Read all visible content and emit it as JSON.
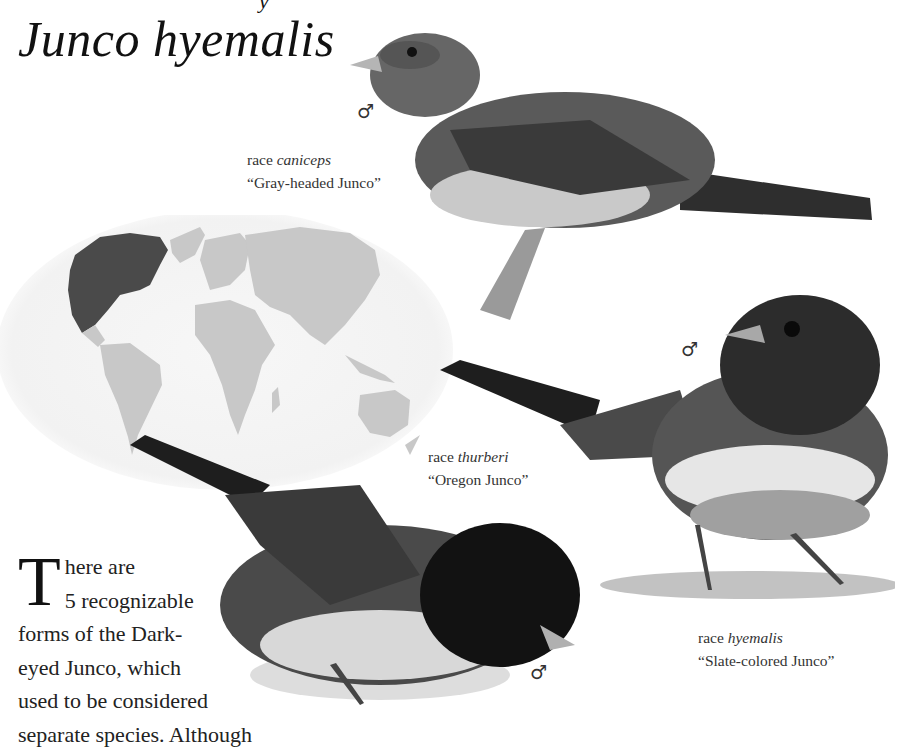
{
  "page": {
    "title_fragment": "y",
    "title": "Junco hyemalis"
  },
  "figures": {
    "map": {
      "label": "range-map",
      "range_color": "#4a4a4a",
      "land_color": "#c8c8c8",
      "ocean_color": "#f4f4f4"
    },
    "birds": [
      {
        "id": "caniceps",
        "sex_symbol": "♂",
        "race_prefix": "race ",
        "race_name": "caniceps",
        "common_name": "“Gray-headed Junco”"
      },
      {
        "id": "thurberi",
        "sex_symbol": "♂",
        "race_prefix": "race ",
        "race_name": "thurberi",
        "common_name": "“Oregon Junco”"
      },
      {
        "id": "hyemalis",
        "sex_symbol": "♂",
        "race_prefix": "race ",
        "race_name": "hyemalis",
        "common_name": "“Slate-colored Junco”"
      },
      {
        "id": "bottom-bird",
        "sex_symbol": "♂"
      }
    ]
  },
  "body": {
    "drop_cap": "T",
    "lines": [
      "here are",
      "5 recognizable",
      "forms of the Dark-",
      "eyed Junco, which",
      "used to be considered",
      "separate species. Although"
    ]
  }
}
